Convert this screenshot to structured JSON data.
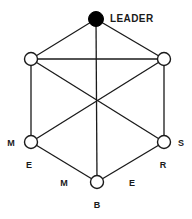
{
  "diagram": {
    "colors": {
      "background": "#ffffff",
      "stroke": "#1a1a1a",
      "leader_fill": "#000000",
      "node_fill": "#ffffff"
    },
    "leader": {
      "label": "LEADER",
      "icon": "filled-circle-node",
      "x": 96,
      "y": 19,
      "r": 7.5,
      "label_x": 110,
      "label_y": 22
    },
    "nodes": [
      {
        "id": "upper-left",
        "label": "",
        "icon": "hollow-circle-node",
        "x": 31,
        "y": 59,
        "r": 6.5
      },
      {
        "id": "upper-right",
        "label": "",
        "icon": "hollow-circle-node",
        "x": 164,
        "y": 59,
        "r": 6.5
      },
      {
        "id": "lower-left",
        "label": "M",
        "icon": "hollow-circle-node",
        "x": 31,
        "y": 142,
        "r": 6.5
      },
      {
        "id": "lower-right",
        "label": "S",
        "icon": "hollow-circle-node",
        "x": 164,
        "y": 142,
        "r": 6.5
      },
      {
        "id": "bottom",
        "label": "B",
        "icon": "hollow-circle-node",
        "x": 97,
        "y": 182,
        "r": 6.5
      }
    ],
    "labels": [
      {
        "id": "label-lower-left-m",
        "text": "M",
        "x": 11,
        "y": 146
      },
      {
        "id": "label-lower-left-e",
        "text": "E",
        "x": 29,
        "y": 168
      },
      {
        "id": "label-bottom-m",
        "text": "M",
        "x": 64,
        "y": 186
      },
      {
        "id": "label-bottom-b",
        "text": "B",
        "x": 97,
        "y": 208
      },
      {
        "id": "label-bottom-e",
        "text": "E",
        "x": 132,
        "y": 186
      },
      {
        "id": "label-lower-right-r",
        "text": "R",
        "x": 163,
        "y": 168
      },
      {
        "id": "label-lower-right-s",
        "text": "S",
        "x": 181,
        "y": 146
      }
    ],
    "edges": [
      {
        "id": "leader-to-upper-left",
        "x1": 96,
        "y1": 19,
        "x2": 31,
        "y2": 59
      },
      {
        "id": "leader-to-upper-right",
        "x1": 96,
        "y1": 19,
        "x2": 164,
        "y2": 59
      },
      {
        "id": "leader-to-bottom",
        "x1": 96,
        "y1": 19,
        "x2": 97,
        "y2": 182
      },
      {
        "id": "upper-left-to-upper-right",
        "x1": 31,
        "y1": 59,
        "x2": 164,
        "y2": 59
      },
      {
        "id": "upper-left-to-lower-left",
        "x1": 31,
        "y1": 59,
        "x2": 31,
        "y2": 142
      },
      {
        "id": "upper-right-to-lower-right",
        "x1": 164,
        "y1": 59,
        "x2": 164,
        "y2": 142
      },
      {
        "id": "upper-left-to-lower-right",
        "x1": 31,
        "y1": 59,
        "x2": 164,
        "y2": 142
      },
      {
        "id": "upper-right-to-lower-left",
        "x1": 164,
        "y1": 59,
        "x2": 31,
        "y2": 142
      },
      {
        "id": "lower-left-to-bottom",
        "x1": 31,
        "y1": 142,
        "x2": 97,
        "y2": 182
      },
      {
        "id": "lower-right-to-bottom",
        "x1": 164,
        "y1": 142,
        "x2": 97,
        "y2": 182
      }
    ],
    "crossing_point": {
      "id": "center-crossing",
      "x": 97,
      "y": 107
    }
  }
}
